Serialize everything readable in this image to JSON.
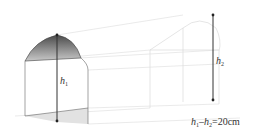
{
  "diagram": {
    "type": "tunnel-3d-geometry",
    "labels": {
      "h1": {
        "main": "h",
        "sub": "1"
      },
      "h2": {
        "main": "h",
        "sub": "2"
      },
      "equation": {
        "part1": "h",
        "sub1": "1",
        "minus": "–",
        "part2": "h",
        "sub2": "2",
        "rest": "=20cm"
      }
    },
    "colors": {
      "front_arch_fill_top": "#555555",
      "front_arch_fill_bottom": "#bbbbbb",
      "floor_shade": "#dddddd",
      "line_dark": "#333333",
      "line_light": "#cccccc"
    }
  }
}
